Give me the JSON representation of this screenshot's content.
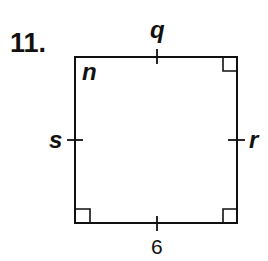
{
  "problem": {
    "number": "11."
  },
  "figure": {
    "shape": "square",
    "labels": {
      "angle": "n",
      "top": "q",
      "left": "s",
      "right": "r",
      "bottom": "6"
    },
    "colors": {
      "stroke": "#111111",
      "background": "#ffffff"
    }
  }
}
